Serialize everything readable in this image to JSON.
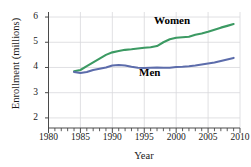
{
  "chart_data": {
    "type": "line",
    "title": "",
    "xlabel": "Year",
    "ylabel": "Enrollment (millions)",
    "xlim": [
      1980,
      2010
    ],
    "ylim": [
      1.6,
      6.2
    ],
    "xticks": [
      1980,
      1985,
      1990,
      1995,
      2000,
      2005,
      2010
    ],
    "xtick_labels": [
      "1980",
      "1985",
      "1990",
      "1995",
      "2000",
      "2005",
      "2010"
    ],
    "yticks": [
      2,
      3,
      4,
      5,
      6
    ],
    "ytick_labels": [
      "2",
      "3",
      "4",
      "5",
      "6"
    ],
    "minor_xtick_step": 1,
    "grid": "both-major",
    "legend_position": "inline-annotations",
    "series": [
      {
        "name": "Women",
        "color": "#3c9a63",
        "label_x": 1998,
        "label_y": 5.55,
        "x": [
          1984,
          1985,
          1986,
          1987,
          1988,
          1989,
          1990,
          1991,
          1992,
          1993,
          1994,
          1995,
          1996,
          1997,
          1998,
          1999,
          2000,
          2001,
          2002,
          2003,
          2004,
          2005,
          2006,
          2007,
          2008,
          2009
        ],
        "values": [
          3.85,
          3.9,
          4.05,
          4.2,
          4.35,
          4.5,
          4.6,
          4.65,
          4.7,
          4.72,
          4.75,
          4.78,
          4.8,
          4.85,
          5.0,
          5.12,
          5.18,
          5.2,
          5.22,
          5.3,
          5.35,
          5.42,
          5.5,
          5.58,
          5.65,
          5.72
        ]
      },
      {
        "name": "Men",
        "color": "#5c6cab",
        "label_x": 1993,
        "label_y": 3.38,
        "x": [
          1984,
          1985,
          1986,
          1987,
          1988,
          1989,
          1990,
          1991,
          1992,
          1993,
          1994,
          1995,
          1996,
          1997,
          1998,
          1999,
          2000,
          2001,
          2002,
          2003,
          2004,
          2005,
          2006,
          2007,
          2008,
          2009
        ],
        "values": [
          3.82,
          3.78,
          3.82,
          3.9,
          3.95,
          4.0,
          4.08,
          4.1,
          4.08,
          4.03,
          3.99,
          3.98,
          3.99,
          4.0,
          3.99,
          3.99,
          4.02,
          4.03,
          4.05,
          4.08,
          4.12,
          4.16,
          4.2,
          4.26,
          4.32,
          4.38
        ]
      }
    ]
  },
  "axes": {
    "ylabel_text": "Enrollment (millions)",
    "xlabel_text": "Year"
  }
}
